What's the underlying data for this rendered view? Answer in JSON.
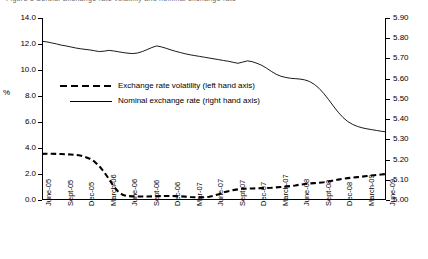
{
  "figure": {
    "cut_off_header": "Figure 8   Serbia: Exchange rate volatility and nominal exchange rate"
  },
  "chart_data": {
    "type": "line",
    "title": "",
    "xlabel": "",
    "ylabel": "%",
    "grid": false,
    "legend_position": "inside-left-middle",
    "categories": [
      "June-05",
      "Sept-05",
      "Dec-05",
      "March-06",
      "June-06",
      "Sept-06",
      "Dec-06",
      "Mar-07",
      "June-07",
      "Sept-07",
      "Dec-07",
      "March-07",
      "June-08",
      "Sept-08",
      "Dec-08",
      "March-09",
      "June-09"
    ],
    "left_axis": {
      "label": "%",
      "ylim": [
        0.0,
        14.0
      ],
      "step": 2.0,
      "ticks": [
        "0.0",
        "2.0",
        "4.0",
        "6.0",
        "8.0",
        "10.0",
        "12.0",
        "14.0"
      ]
    },
    "right_axis": {
      "label": "",
      "ylim": [
        5.0,
        5.9
      ],
      "step": 0.1,
      "ticks": [
        "5.00",
        "5.10",
        "5.20",
        "5.30",
        "5.40",
        "5.50",
        "5.60",
        "5.70",
        "5.80",
        "5.90"
      ]
    },
    "series": [
      {
        "name": "Exchange rate volatility (left hand axis)",
        "axis": "left",
        "style": "dashed",
        "color": "#000000",
        "x": [
          0,
          0.5,
          1,
          1.5,
          2,
          2.5,
          3,
          3.5,
          4,
          4.5,
          5,
          5.5,
          6,
          6.5,
          7,
          7.5,
          8,
          8.5,
          9,
          9.5,
          10,
          10.5,
          11,
          11.5,
          12,
          12.5,
          13,
          13.5,
          14,
          14.5,
          15,
          15.5,
          16
        ],
        "values": [
          3.55,
          3.55,
          3.52,
          3.45,
          3.3,
          2.9,
          2.3,
          1.55,
          0.8,
          0.42,
          0.3,
          0.28,
          0.27,
          0.27,
          0.28,
          0.3,
          0.31,
          0.3,
          0.28,
          0.25,
          0.22,
          0.2,
          0.22,
          0.3,
          0.45,
          0.62,
          0.75,
          0.82,
          0.88,
          0.9,
          0.92,
          0.95,
          1.0
        ]
      },
      {
        "name": "Nominal exchange rate (right hand axis)",
        "axis": "right",
        "style": "solid",
        "color": "#000000",
        "x": [
          0,
          0.5,
          1,
          1.5,
          2,
          2.5,
          3,
          3.5,
          4,
          4.5,
          5,
          5.5,
          6,
          6.5,
          7,
          7.5,
          8,
          8.5,
          9,
          9.5,
          10,
          10.5,
          11,
          11.5,
          12,
          12.5,
          13,
          13.5,
          14,
          14.5,
          15,
          15.5,
          16
        ],
        "values": [
          5.785,
          5.775,
          5.76,
          5.745,
          5.735,
          5.74,
          5.73,
          5.725,
          5.735,
          5.755,
          5.765,
          5.75,
          5.74,
          5.73,
          5.72,
          5.71,
          5.7,
          5.695,
          5.685,
          5.7,
          5.69,
          5.66,
          5.64,
          5.6,
          5.56,
          5.58,
          5.555,
          5.545,
          5.575,
          5.57,
          5.52,
          5.47,
          5.42
        ]
      }
    ],
    "legend": [
      {
        "label": "Exchange rate volatility (left hand axis)",
        "style": "dashed"
      },
      {
        "label": "Nominal exchange rate (right hand axis)",
        "style": "solid"
      }
    ]
  },
  "series_points": {
    "volatility": [
      [
        0,
        3.55
      ],
      [
        1,
        3.56
      ],
      [
        2,
        3.56
      ],
      [
        3,
        3.55
      ],
      [
        4,
        3.54
      ],
      [
        5,
        3.52
      ],
      [
        6,
        3.5
      ],
      [
        7,
        3.47
      ],
      [
        8,
        3.42
      ],
      [
        9,
        3.32
      ],
      [
        10,
        3.18
      ],
      [
        11,
        2.95
      ],
      [
        12,
        2.6
      ],
      [
        13,
        2.15
      ],
      [
        14,
        1.62
      ],
      [
        15,
        1.05
      ],
      [
        16,
        0.62
      ],
      [
        17,
        0.38
      ],
      [
        18,
        0.3
      ],
      [
        19,
        0.28
      ],
      [
        20,
        0.27
      ],
      [
        21,
        0.27
      ],
      [
        22,
        0.27
      ],
      [
        23,
        0.28
      ],
      [
        24,
        0.29
      ],
      [
        25,
        0.3
      ],
      [
        26,
        0.31
      ],
      [
        27,
        0.31
      ],
      [
        28,
        0.3
      ],
      [
        29,
        0.28
      ],
      [
        30,
        0.26
      ],
      [
        31,
        0.23
      ],
      [
        32,
        0.21
      ],
      [
        33,
        0.2
      ],
      [
        34,
        0.21
      ],
      [
        35,
        0.25
      ],
      [
        36,
        0.33
      ],
      [
        37,
        0.45
      ],
      [
        38,
        0.58
      ],
      [
        39,
        0.68
      ],
      [
        40,
        0.76
      ],
      [
        41,
        0.82
      ],
      [
        42,
        0.86
      ],
      [
        43,
        0.88
      ],
      [
        44,
        0.89
      ],
      [
        45,
        0.9
      ],
      [
        46,
        0.91
      ],
      [
        47,
        0.92
      ],
      [
        48,
        0.94
      ],
      [
        49,
        0.97
      ],
      [
        50,
        1.0
      ],
      [
        51,
        1.03
      ],
      [
        52,
        1.07
      ],
      [
        53,
        1.12
      ],
      [
        54,
        1.18
      ],
      [
        55,
        1.23
      ],
      [
        56,
        1.27
      ],
      [
        57,
        1.3
      ],
      [
        58,
        1.33
      ],
      [
        59,
        1.37
      ],
      [
        60,
        1.43
      ],
      [
        61,
        1.5
      ],
      [
        62,
        1.57
      ],
      [
        63,
        1.63
      ],
      [
        64,
        1.68
      ],
      [
        65,
        1.72
      ],
      [
        66,
        1.76
      ],
      [
        67,
        1.8
      ],
      [
        68,
        1.84
      ],
      [
        69,
        1.88
      ],
      [
        70,
        1.92
      ],
      [
        71,
        1.96
      ],
      [
        72,
        2.0
      ]
    ],
    "nominal": [
      [
        0,
        5.785
      ],
      [
        1,
        5.782
      ],
      [
        2,
        5.777
      ],
      [
        3,
        5.772
      ],
      [
        4,
        5.766
      ],
      [
        5,
        5.762
      ],
      [
        6,
        5.757
      ],
      [
        7,
        5.752
      ],
      [
        8,
        5.748
      ],
      [
        9,
        5.745
      ],
      [
        10,
        5.742
      ],
      [
        11,
        5.738
      ],
      [
        12,
        5.734
      ],
      [
        13,
        5.736
      ],
      [
        14,
        5.74
      ],
      [
        15,
        5.737
      ],
      [
        16,
        5.733
      ],
      [
        17,
        5.729
      ],
      [
        18,
        5.726
      ],
      [
        19,
        5.724
      ],
      [
        20,
        5.727
      ],
      [
        21,
        5.734
      ],
      [
        22,
        5.744
      ],
      [
        23,
        5.754
      ],
      [
        24,
        5.762
      ],
      [
        25,
        5.757
      ],
      [
        26,
        5.75
      ],
      [
        27,
        5.742
      ],
      [
        28,
        5.735
      ],
      [
        29,
        5.729
      ],
      [
        30,
        5.723
      ],
      [
        31,
        5.718
      ],
      [
        32,
        5.714
      ],
      [
        33,
        5.71
      ],
      [
        34,
        5.706
      ],
      [
        35,
        5.702
      ],
      [
        36,
        5.698
      ],
      [
        37,
        5.694
      ],
      [
        38,
        5.69
      ],
      [
        39,
        5.686
      ],
      [
        40,
        5.681
      ],
      [
        41,
        5.676
      ],
      [
        42,
        5.682
      ],
      [
        43,
        5.688
      ],
      [
        44,
        5.684
      ],
      [
        45,
        5.676
      ],
      [
        46,
        5.666
      ],
      [
        47,
        5.652
      ],
      [
        48,
        5.636
      ],
      [
        49,
        5.622
      ],
      [
        50,
        5.612
      ],
      [
        51,
        5.606
      ],
      [
        52,
        5.602
      ],
      [
        53,
        5.6
      ],
      [
        54,
        5.598
      ],
      [
        55,
        5.594
      ],
      [
        56,
        5.586
      ],
      [
        57,
        5.572
      ],
      [
        58,
        5.552
      ],
      [
        59,
        5.526
      ],
      [
        60,
        5.496
      ],
      [
        61,
        5.464
      ],
      [
        62,
        5.434
      ],
      [
        63,
        5.408
      ],
      [
        64,
        5.388
      ],
      [
        65,
        5.374
      ],
      [
        66,
        5.364
      ],
      [
        67,
        5.357
      ],
      [
        68,
        5.352
      ],
      [
        69,
        5.348
      ],
      [
        70,
        5.344
      ],
      [
        71,
        5.34
      ],
      [
        72,
        5.337
      ]
    ]
  }
}
